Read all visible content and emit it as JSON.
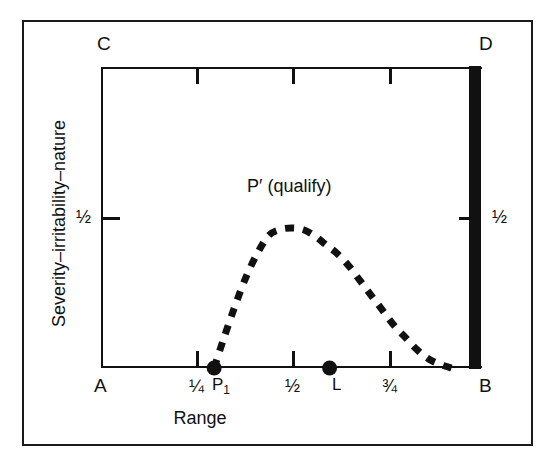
{
  "figure": {
    "x_axis_title": "Range",
    "y_axis_title": "Severity–irritability–nature",
    "annotation": "P′ (qualify)",
    "corners": {
      "top_left": "C",
      "top_right": "D",
      "bottom_left": "A",
      "bottom_right": "B"
    },
    "x_tick_labels": [
      "¼",
      "½",
      "¾"
    ],
    "y_tick_label_left": "½",
    "y_tick_label_right": "½",
    "point_labels": {
      "p1": "P",
      "p1_sub": "1",
      "l": "L"
    },
    "colors": {
      "ink": "#111111",
      "frame": "#1a1a1a",
      "background": "#ffffff"
    }
  },
  "chart_data": {
    "type": "line",
    "title": "",
    "xlabel": "Range",
    "ylabel": "Severity–irritability–nature",
    "xlim": [
      0,
      1
    ],
    "ylim": [
      0,
      1
    ],
    "grid": false,
    "legend": "none",
    "x_ticks": [
      0.25,
      0.5,
      0.75
    ],
    "x_tick_labels": [
      "¼",
      "½",
      "¾"
    ],
    "y_ticks": [
      0.5
    ],
    "y_tick_labels": [
      "½"
    ],
    "axis_corner_labels": {
      "A": [
        0,
        0
      ],
      "B": [
        1,
        0
      ],
      "C": [
        0,
        1
      ],
      "D": [
        1,
        1
      ]
    },
    "series": [
      {
        "name": "P′ (qualify)",
        "style": "dashed",
        "x": [
          0.297,
          0.32,
          0.35,
          0.38,
          0.41,
          0.44,
          0.47,
          0.5,
          0.53,
          0.56,
          0.59,
          0.62,
          0.65,
          0.68,
          0.71,
          0.74,
          0.77,
          0.8,
          0.83,
          0.86,
          0.89,
          0.92
        ],
        "y": [
          0.0,
          0.09,
          0.2,
          0.3,
          0.38,
          0.44,
          0.46,
          0.465,
          0.46,
          0.44,
          0.41,
          0.38,
          0.34,
          0.29,
          0.24,
          0.19,
          0.14,
          0.1,
          0.06,
          0.03,
          0.012,
          0.0
        ]
      }
    ],
    "markers": [
      {
        "label": "P₁",
        "x": 0.297,
        "y": 0.0,
        "style": "filled-circle"
      },
      {
        "label": "L",
        "x": 0.6,
        "y": 0.0,
        "style": "filled-circle"
      }
    ],
    "annotations": [
      {
        "text": "P′ (qualify)",
        "x": 0.555,
        "y": 0.645
      }
    ],
    "shaded_regions": [
      {
        "name": "right-bar",
        "x_from": 0.965,
        "x_to": 1.0,
        "y_from": 0.0,
        "y_to": 1.0,
        "color": "#111111"
      }
    ]
  }
}
